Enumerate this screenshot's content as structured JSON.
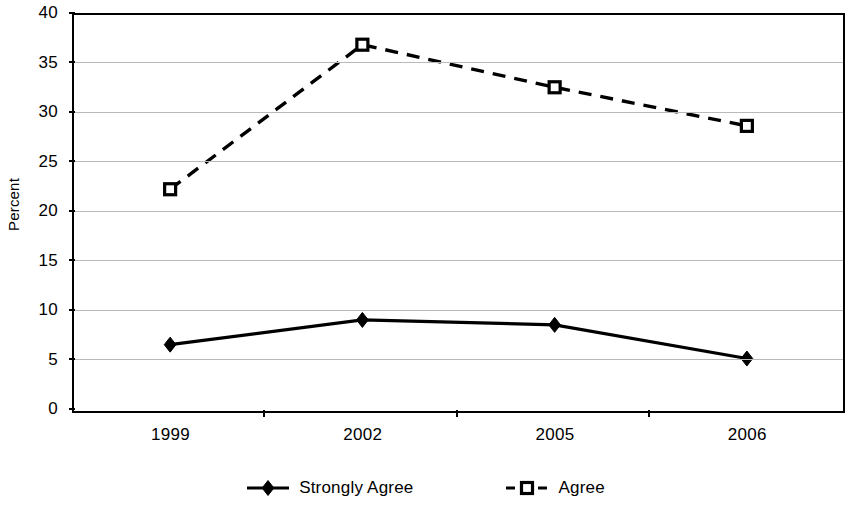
{
  "chart_data": {
    "type": "line",
    "title": "",
    "xlabel": "",
    "ylabel": "Percent",
    "categories": [
      "1999",
      "2002",
      "2005",
      "2006"
    ],
    "ylim": [
      0,
      40
    ],
    "yticks": [
      0,
      5,
      10,
      15,
      20,
      25,
      30,
      35,
      40
    ],
    "ytick_labels": [
      "0",
      "5",
      "10",
      "15",
      "20",
      "25",
      "30",
      "35",
      "40"
    ],
    "grid": "horizontal",
    "legend_position": "bottom",
    "series": [
      {
        "name": "Strongly Agree",
        "values": [
          6.7,
          9.2,
          8.7,
          5.3
        ],
        "line_style": "solid",
        "marker": "filled-diamond",
        "color": "#000000"
      },
      {
        "name": "Agree",
        "values": [
          22.4,
          37.0,
          32.7,
          28.8
        ],
        "line_style": "dashed",
        "marker": "open-square",
        "color": "#000000"
      }
    ]
  },
  "axes": {
    "y_title": "Percent"
  },
  "legend": {
    "entries": [
      {
        "label": "Strongly Agree",
        "marker": "filled-diamond",
        "line_style": "solid"
      },
      {
        "label": "Agree",
        "marker": "open-square",
        "line_style": "dashed"
      }
    ]
  },
  "colors": {
    "ink": "#000000",
    "grid": "#b9b9b9",
    "background": "#ffffff"
  }
}
